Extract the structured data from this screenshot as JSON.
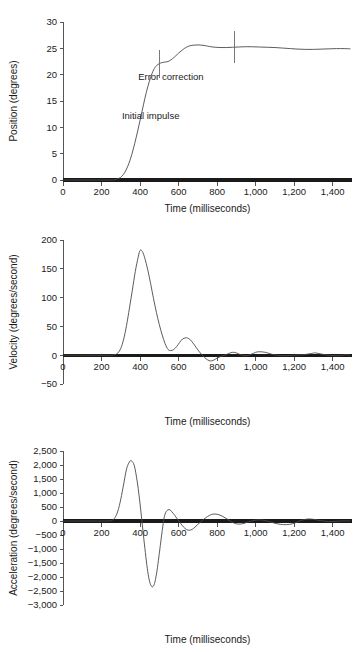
{
  "figure": {
    "name": "rapid-aiming-movement-kinematics",
    "panel_count": 3
  },
  "chart_data": [
    {
      "id": "position",
      "type": "line",
      "title": "",
      "xlabel": "Time (milliseconds)",
      "ylabel": "Position (degrees)",
      "xlim": [
        0,
        1500
      ],
      "ylim": [
        0,
        30
      ],
      "xticks": [
        0,
        200,
        400,
        600,
        800,
        1000,
        1200,
        1400
      ],
      "xticklabels": [
        "0",
        "200",
        "400",
        "600",
        "800",
        "1,000",
        "1,200",
        "1,400"
      ],
      "yticks": [
        0,
        5,
        10,
        15,
        20,
        25,
        30
      ],
      "yticklabels": [
        "0",
        "5",
        "10",
        "15",
        "20",
        "25",
        "30"
      ],
      "grid": false,
      "legend": "none",
      "annotations": [
        {
          "text": "Error correction",
          "x": 560,
          "y": 19.0
        },
        {
          "text": "Initial impulse",
          "x": 455,
          "y": 11.5
        }
      ],
      "markers": [
        {
          "x": 500,
          "y0": 19.3,
          "y1": 24.6
        },
        {
          "x": 890,
          "y0": 22.3,
          "y1": 28.3
        }
      ],
      "x": [
        0,
        60,
        120,
        180,
        240,
        270,
        290,
        305,
        320,
        335,
        350,
        365,
        380,
        395,
        410,
        425,
        440,
        455,
        470,
        485,
        500,
        515,
        530,
        545,
        560,
        580,
        600,
        620,
        640,
        660,
        680,
        700,
        720,
        740,
        760,
        790,
        820,
        850,
        880,
        910,
        940,
        980,
        1020,
        1060,
        1100,
        1140,
        1180,
        1220,
        1260,
        1300,
        1340,
        1380,
        1420,
        1460,
        1490
      ],
      "y": [
        0,
        0,
        0,
        0,
        0,
        0.05,
        0.3,
        0.7,
        1.4,
        2.5,
        4.0,
        5.9,
        8.1,
        10.5,
        13.0,
        15.5,
        17.7,
        19.5,
        20.9,
        21.7,
        22.1,
        22.3,
        22.4,
        22.5,
        22.8,
        23.4,
        24.1,
        24.7,
        25.2,
        25.5,
        25.6,
        25.65,
        25.6,
        25.5,
        25.35,
        25.2,
        25.15,
        25.15,
        25.2,
        25.25,
        25.3,
        25.3,
        25.25,
        25.2,
        25.15,
        25.05,
        24.95,
        24.85,
        24.8,
        24.8,
        24.85,
        24.9,
        24.95,
        24.95,
        24.9
      ]
    },
    {
      "id": "velocity",
      "type": "line",
      "title": "",
      "xlabel": "Time (milliseconds)",
      "ylabel": "Velocity (degrees/second)",
      "xlim": [
        0,
        1500
      ],
      "ylim": [
        -50,
        200
      ],
      "xticks": [
        0,
        200,
        400,
        600,
        800,
        1000,
        1200,
        1400
      ],
      "xticklabels": [
        "0",
        "200",
        "400",
        "600",
        "800",
        "1,000",
        "1,200",
        "1,400"
      ],
      "yticks": [
        -50,
        0,
        50,
        100,
        150,
        200
      ],
      "yticklabels": [
        "-50",
        "0",
        "50",
        "100",
        "150",
        "200"
      ],
      "grid": false,
      "legend": "none",
      "annotations": [],
      "markers": [],
      "x": [
        0,
        80,
        160,
        240,
        270,
        285,
        300,
        315,
        330,
        345,
        360,
        375,
        390,
        400,
        412,
        425,
        440,
        455,
        470,
        485,
        500,
        515,
        530,
        545,
        560,
        575,
        590,
        605,
        620,
        635,
        645,
        660,
        675,
        690,
        705,
        720,
        735,
        750,
        765,
        780,
        800,
        820,
        840,
        860,
        880,
        900,
        920,
        950,
        980,
        1000,
        1020,
        1050,
        1080,
        1110,
        1150,
        1200,
        1250,
        1290,
        1310,
        1340,
        1380,
        1420,
        1450,
        1470,
        1490
      ],
      "y": [
        0,
        0,
        0,
        0,
        1,
        4,
        12,
        28,
        52,
        82,
        113,
        145,
        170,
        182,
        180,
        168,
        148,
        124,
        98,
        74,
        53,
        35,
        20,
        10,
        8,
        10,
        15,
        22,
        28,
        30,
        30,
        27,
        21,
        14,
        7,
        1,
        -4,
        -8,
        -10,
        -9,
        -5,
        -2,
        0,
        3,
        5,
        4,
        1,
        -1,
        2,
        5,
        6,
        5,
        2,
        0,
        -1,
        0,
        1,
        3,
        4,
        2,
        0,
        -1,
        0,
        1,
        0
      ]
    },
    {
      "id": "acceleration",
      "type": "line",
      "title": "",
      "xlabel": "Time (milliseconds)",
      "ylabel": "Acceleration (degrees/second)",
      "xlim": [
        0,
        1500
      ],
      "ylim": [
        -3000,
        2500
      ],
      "xticks": [
        0,
        200,
        400,
        600,
        800,
        1000,
        1200,
        1400
      ],
      "xticklabels": [
        "0",
        "200",
        "400",
        "600",
        "800",
        "1,000",
        "1,200",
        "1,400"
      ],
      "yticks": [
        -3000,
        -2500,
        -2000,
        -1500,
        -1000,
        -500,
        0,
        500,
        1000,
        1500,
        2000,
        2500
      ],
      "yticklabels": [
        "-3,000",
        "-2,500",
        "-2,000",
        "-1,500",
        "-1,000",
        "-500",
        "0",
        "500",
        "1,000",
        "1,500",
        "2,000",
        "2,500"
      ],
      "grid": false,
      "legend": "none",
      "annotations": [],
      "markers": [],
      "x": [
        0,
        80,
        160,
        230,
        255,
        270,
        285,
        300,
        315,
        330,
        345,
        355,
        370,
        385,
        395,
        405,
        415,
        425,
        435,
        445,
        455,
        465,
        475,
        485,
        495,
        505,
        515,
        525,
        535,
        545,
        555,
        565,
        580,
        595,
        610,
        625,
        640,
        655,
        670,
        685,
        700,
        715,
        730,
        750,
        770,
        790,
        810,
        830,
        850,
        870,
        890,
        910,
        930,
        950,
        980,
        1010,
        1040,
        1070,
        1100,
        1130,
        1160,
        1190,
        1215,
        1240,
        1270,
        1300,
        1340,
        1380,
        1420,
        1460,
        1490
      ],
      "y": [
        0,
        0,
        0,
        0,
        30,
        120,
        360,
        780,
        1320,
        1860,
        2110,
        2150,
        1980,
        1420,
        900,
        300,
        -350,
        -980,
        -1560,
        -2020,
        -2280,
        -2350,
        -2230,
        -1900,
        -1420,
        -880,
        -340,
        120,
        330,
        395,
        400,
        330,
        200,
        60,
        -80,
        -210,
        -300,
        -330,
        -300,
        -220,
        -120,
        -30,
        60,
        160,
        230,
        250,
        220,
        160,
        80,
        -10,
        -80,
        -110,
        -100,
        -60,
        0,
        40,
        30,
        -20,
        -80,
        -120,
        -130,
        -100,
        -40,
        30,
        70,
        60,
        10,
        -20,
        -10,
        5,
        0
      ]
    }
  ]
}
